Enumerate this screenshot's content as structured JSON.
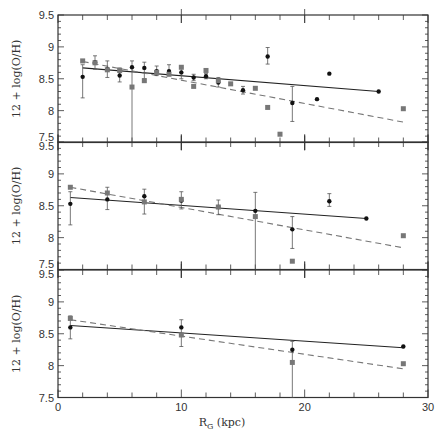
{
  "chart_data": [
    {
      "type": "scatter",
      "panel": "top",
      "ylabel": "12 + log(O/H)",
      "xlabel": "R_G (kpc)",
      "xlim": [
        0,
        30
      ],
      "ylim": [
        7.5,
        9.5
      ],
      "yticks": [
        7.5,
        8,
        8.5,
        9,
        9.5
      ],
      "series": [
        {
          "name": "circles",
          "marker": "circle",
          "color": "#111111",
          "points": [
            {
              "x": 2,
              "y": 8.53,
              "lo": 8.2,
              "hi": 8.72
            },
            {
              "x": 3,
              "y": 8.76,
              "lo": 8.65,
              "hi": 8.86
            },
            {
              "x": 4,
              "y": 8.65,
              "lo": 8.52,
              "hi": 8.78
            },
            {
              "x": 5,
              "y": 8.55,
              "lo": 8.45,
              "hi": 8.67
            },
            {
              "x": 6,
              "y": 8.68,
              "lo": 7.5,
              "hi": 8.78
            },
            {
              "x": 7,
              "y": 8.67,
              "lo": 8.5,
              "hi": 8.76
            },
            {
              "x": 8,
              "y": 8.62,
              "lo": 8.55,
              "hi": 8.7
            },
            {
              "x": 9,
              "y": 8.62,
              "lo": 8.55,
              "hi": 8.72
            },
            {
              "x": 10,
              "y": 8.6,
              "lo": 8.5,
              "hi": 8.68
            },
            {
              "x": 11,
              "y": 8.52,
              "lo": 8.47,
              "hi": 8.57
            },
            {
              "x": 12,
              "y": 8.54,
              "lo": 8.5,
              "hi": 8.58
            },
            {
              "x": 13,
              "y": 8.44,
              "lo": 8.37,
              "hi": 8.52
            },
            {
              "x": 15,
              "y": 8.32,
              "lo": 8.26,
              "hi": 8.38
            },
            {
              "x": 17,
              "y": 8.85,
              "lo": 8.73,
              "hi": 8.99
            },
            {
              "x": 19,
              "y": 8.12,
              "lo": 7.83,
              "hi": 8.38
            },
            {
              "x": 21,
              "y": 8.18
            },
            {
              "x": 22,
              "y": 8.58
            },
            {
              "x": 26,
              "y": 8.3
            }
          ]
        },
        {
          "name": "squares",
          "marker": "square",
          "color": "#777777",
          "points": [
            {
              "x": 2,
              "y": 8.78
            },
            {
              "x": 3,
              "y": 8.75
            },
            {
              "x": 4,
              "y": 8.64
            },
            {
              "x": 5,
              "y": 8.63
            },
            {
              "x": 6,
              "y": 8.37
            },
            {
              "x": 7,
              "y": 8.47
            },
            {
              "x": 8,
              "y": 8.6
            },
            {
              "x": 9,
              "y": 8.57
            },
            {
              "x": 10,
              "y": 8.68
            },
            {
              "x": 11,
              "y": 8.38
            },
            {
              "x": 12,
              "y": 8.63
            },
            {
              "x": 13,
              "y": 8.47
            },
            {
              "x": 14,
              "y": 8.42
            },
            {
              "x": 16,
              "y": 8.35
            },
            {
              "x": 17,
              "y": 8.05
            },
            {
              "x": 18,
              "y": 7.63
            },
            {
              "x": 28,
              "y": 8.03
            }
          ]
        }
      ],
      "fits": [
        {
          "name": "solid-fit",
          "style": "solid",
          "from": [
            2,
            8.67
          ],
          "to": [
            26,
            8.3
          ]
        },
        {
          "name": "dashed-fit",
          "style": "dashed",
          "from": [
            2,
            8.77
          ],
          "to": [
            28,
            7.82
          ]
        }
      ]
    },
    {
      "type": "scatter",
      "panel": "middle",
      "ylabel": "12 + log(O/H)",
      "xlim": [
        0,
        30
      ],
      "ylim": [
        7.5,
        9.5
      ],
      "yticks": [
        7.5,
        8,
        8.5,
        9,
        9.5
      ],
      "series": [
        {
          "name": "circles",
          "marker": "circle",
          "color": "#111111",
          "points": [
            {
              "x": 1,
              "y": 8.53,
              "lo": 8.2,
              "hi": 8.72
            },
            {
              "x": 4,
              "y": 8.6,
              "lo": 8.44,
              "hi": 8.79
            },
            {
              "x": 7,
              "y": 8.65,
              "lo": 8.37,
              "hi": 8.76
            },
            {
              "x": 10,
              "y": 8.58,
              "lo": 8.45,
              "hi": 8.72
            },
            {
              "x": 13,
              "y": 8.48,
              "lo": 8.36,
              "hi": 8.59
            },
            {
              "x": 16,
              "y": 8.42,
              "lo": 7.5,
              "hi": 8.71
            },
            {
              "x": 19,
              "y": 8.13,
              "lo": 7.83,
              "hi": 8.33
            },
            {
              "x": 22,
              "y": 8.57,
              "lo": 8.49,
              "hi": 8.69
            },
            {
              "x": 25,
              "y": 8.3
            }
          ]
        },
        {
          "name": "squares",
          "marker": "square",
          "color": "#777777",
          "points": [
            {
              "x": 1,
              "y": 8.79
            },
            {
              "x": 4,
              "y": 8.7
            },
            {
              "x": 7,
              "y": 8.56
            },
            {
              "x": 10,
              "y": 8.6
            },
            {
              "x": 13,
              "y": 8.48
            },
            {
              "x": 16,
              "y": 8.33
            },
            {
              "x": 19,
              "y": 7.63
            },
            {
              "x": 28,
              "y": 8.03
            }
          ]
        }
      ],
      "fits": [
        {
          "name": "solid-fit",
          "style": "solid",
          "from": [
            1,
            8.63
          ],
          "to": [
            25,
            8.3
          ]
        },
        {
          "name": "dashed-fit",
          "style": "dashed",
          "from": [
            1,
            8.79
          ],
          "to": [
            28,
            7.84
          ]
        }
      ]
    },
    {
      "type": "scatter",
      "panel": "bottom",
      "ylabel": "12 + log(O/H)",
      "xlabel": "R_G (kpc)",
      "xlim": [
        0,
        30
      ],
      "ylim": [
        7.5,
        9.5
      ],
      "xticks": [
        0,
        10,
        20,
        30
      ],
      "yticks": [
        7.5,
        8,
        8.5,
        9,
        9.5
      ],
      "series": [
        {
          "name": "circles",
          "marker": "circle",
          "color": "#111111",
          "points": [
            {
              "x": 1,
              "y": 8.6,
              "lo": 8.42,
              "hi": 8.78
            },
            {
              "x": 10,
              "y": 8.6,
              "lo": 8.3,
              "hi": 8.72
            },
            {
              "x": 19,
              "y": 8.25,
              "lo": 7.5,
              "hi": 8.38
            },
            {
              "x": 28,
              "y": 8.3
            }
          ]
        },
        {
          "name": "squares",
          "marker": "square",
          "color": "#777777",
          "points": [
            {
              "x": 1,
              "y": 8.74
            },
            {
              "x": 10,
              "y": 8.48
            },
            {
              "x": 19,
              "y": 8.05
            },
            {
              "x": 28,
              "y": 8.03
            }
          ]
        }
      ],
      "fits": [
        {
          "name": "solid-fit",
          "style": "solid",
          "from": [
            1,
            8.63
          ],
          "to": [
            28,
            8.28
          ]
        },
        {
          "name": "dashed-fit",
          "style": "dashed",
          "from": [
            1,
            8.72
          ],
          "to": [
            28,
            7.95
          ]
        }
      ]
    }
  ],
  "labels": {
    "ylabel": "12 + log(O/H)",
    "xlabel_main": "R",
    "xlabel_sub": "G",
    "xlabel_unit": " (kpc)",
    "xtick_labels": [
      "0",
      "10",
      "20",
      "30"
    ],
    "ytick_labels_top": [
      "9.5",
      "9",
      "8.5",
      "8",
      "7.5"
    ],
    "ytick_labels_mid": [
      "9.5",
      "9",
      "8.5",
      "8",
      "7.5"
    ],
    "ytick_labels_bot": [
      "9.5",
      "9",
      "8.5",
      "8",
      "7.5"
    ]
  },
  "colors": {
    "axis": "#333333",
    "circle": "#111111",
    "square": "#777777",
    "solid_line": "#222222",
    "dashed_line": "#777777"
  }
}
